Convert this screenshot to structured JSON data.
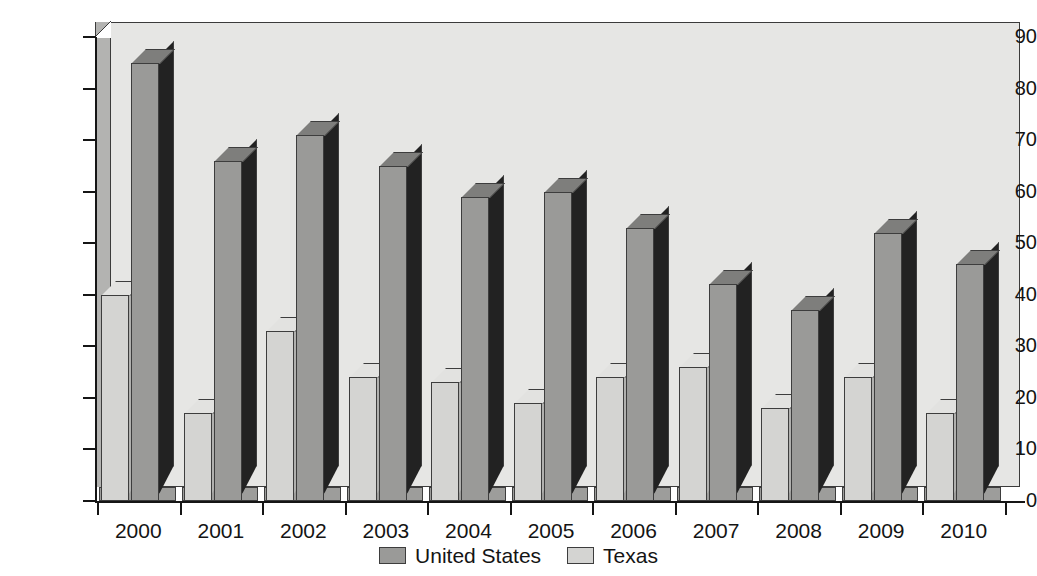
{
  "chart_data": {
    "type": "bar",
    "title": "",
    "xlabel": "",
    "ylabel": "Number of Executions",
    "ylim": [
      0,
      90
    ],
    "ytick_step": 10,
    "yticks": [
      0,
      10,
      20,
      30,
      40,
      50,
      60,
      70,
      80,
      90
    ],
    "grid": false,
    "legend_position": "bottom-center",
    "categories": [
      "2000",
      "2001",
      "2002",
      "2003",
      "2004",
      "2005",
      "2006",
      "2007",
      "2008",
      "2009",
      "2010"
    ],
    "series": [
      {
        "name": "Texas",
        "color": "#d4d4d2",
        "values": [
          40,
          17,
          33,
          24,
          23,
          19,
          24,
          26,
          18,
          24,
          17
        ]
      },
      {
        "name": "United States",
        "color": "#9a9a98",
        "values": [
          85,
          66,
          71,
          65,
          59,
          60,
          53,
          42,
          37,
          52,
          46
        ]
      }
    ],
    "series_draw_order": [
      "Texas",
      "United States"
    ]
  },
  "legend": {
    "items": [
      {
        "label": "United States",
        "swatch": "us"
      },
      {
        "label": "Texas",
        "swatch": "tx"
      }
    ]
  },
  "axes": {
    "y_title": "Number of Executions"
  }
}
